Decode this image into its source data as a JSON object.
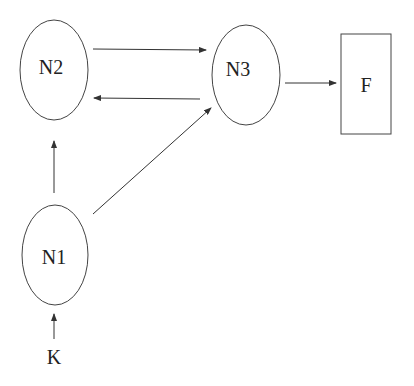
{
  "diagram": {
    "nodes": [
      {
        "id": "N2",
        "label": "N2",
        "shape": "ellipse",
        "cx": 54,
        "cy": 70,
        "rx": 34,
        "ry": 50
      },
      {
        "id": "N3",
        "label": "N3",
        "shape": "ellipse",
        "cx": 246,
        "cy": 75,
        "rx": 34,
        "ry": 50
      },
      {
        "id": "N1",
        "label": "N1",
        "shape": "ellipse",
        "cx": 55,
        "cy": 255,
        "rx": 33,
        "ry": 50
      },
      {
        "id": "F",
        "label": "F",
        "shape": "rectangle",
        "x": 341,
        "y": 34,
        "w": 50,
        "h": 100
      },
      {
        "id": "K",
        "label": "K",
        "shape": "text",
        "x": 54,
        "y": 356
      }
    ],
    "edges": [
      {
        "from": "N2",
        "to": "N3"
      },
      {
        "from": "N3",
        "to": "N2"
      },
      {
        "from": "N3",
        "to": "F"
      },
      {
        "from": "N1",
        "to": "N2"
      },
      {
        "from": "N1",
        "to": "N3"
      },
      {
        "from": "K",
        "to": "N1"
      }
    ],
    "colors": {
      "stroke": "#333333",
      "text": "#222222",
      "background": "#ffffff"
    }
  }
}
